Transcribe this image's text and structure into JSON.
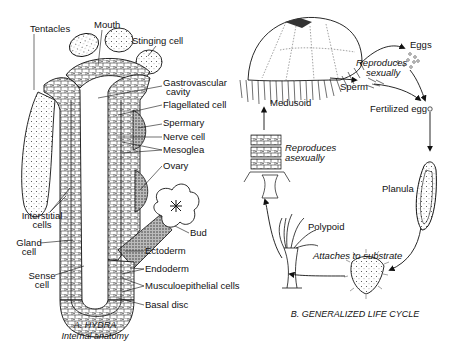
{
  "panel_a": {
    "caption_line1": "A. HYDRA",
    "caption_line2": "Internal anatomy",
    "labels": {
      "tentacles": "Tentacles",
      "mouth": "Mouth",
      "stinging_cell": "Stinging cell",
      "gastrovascular_1": "Gastrovascular",
      "gastrovascular_2": "cavity",
      "flagellated_cell": "Flagellated cell",
      "spermary": "Spermary",
      "nerve_cell": "Nerve cell",
      "mesoglea": "Mesoglea",
      "ovary": "Ovary",
      "interstitial_1": "Interstitial",
      "interstitial_2": "cells",
      "gland_1": "Gland",
      "gland_2": "cell",
      "bud": "Bud",
      "ectoderm": "Ectoderm",
      "endoderm": "Endoderm",
      "sense_1": "Sense",
      "sense_2": "cell",
      "musculoepithelial": "Musculoepithelial cells",
      "basal_disc": "Basal disc"
    }
  },
  "panel_b": {
    "caption": "B. GENERALIZED LIFE CYCLE",
    "labels": {
      "eggs": "Eggs",
      "reproduces_sexually_1": "Reproduces",
      "reproduces_sexually_2": "sexually",
      "sperm": "Sperm",
      "fertilized_egg": "Fertilized egg",
      "medusoid": "Medusoid",
      "reproduces_asexually_1": "Reproduces",
      "reproduces_asexually_2": "asexually",
      "planula": "Planula",
      "polypoid": "Polypoid",
      "attaches": "Attaches to substrate"
    }
  }
}
